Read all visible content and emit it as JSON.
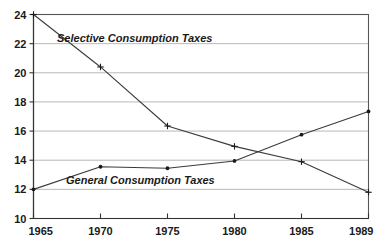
{
  "chart_data": {
    "type": "line",
    "title": "",
    "xlabel": "",
    "ylabel": "",
    "x": [
      1965,
      1970,
      1975,
      1980,
      1985,
      1989
    ],
    "categories": [
      "1965",
      "1970",
      "1975",
      "1980",
      "1985",
      "1989"
    ],
    "xtick_labels": [
      "1965",
      "1970",
      "1975",
      "1980",
      "1985",
      "1989"
    ],
    "ytick_labels": [
      "10",
      "12",
      "14",
      "16",
      "18",
      "20",
      "22",
      "24"
    ],
    "ytick_values": [
      10,
      12,
      14,
      16,
      18,
      20,
      22,
      24
    ],
    "ylim": [
      10,
      24
    ],
    "xlim": [
      1965,
      1989
    ],
    "grid": "horizontal",
    "legend_position": "inline-annotation",
    "series": [
      {
        "name": "Selective Consumption Taxes",
        "label": "Selective Consumption Taxes",
        "marker": "cross",
        "values": [
          24.0,
          20.4,
          16.35,
          14.95,
          13.9,
          11.8
        ]
      },
      {
        "name": "General Consumption Taxes",
        "label": "General Consumption Taxes",
        "marker": "dot",
        "values": [
          12.0,
          13.55,
          13.45,
          13.95,
          15.75,
          17.35
        ]
      }
    ],
    "annotations": [
      {
        "text": "Selective Consumption Taxes",
        "x_px": 57,
        "y_px": 42
      },
      {
        "text": "General Consumption Taxes",
        "x_px": 66,
        "y_px": 184
      }
    ],
    "colors": {
      "line": "#3b3b3b",
      "grid": "#9a9a9a",
      "frame": "#555555",
      "text": "#1a1a1a",
      "background": "#ffffff"
    }
  }
}
